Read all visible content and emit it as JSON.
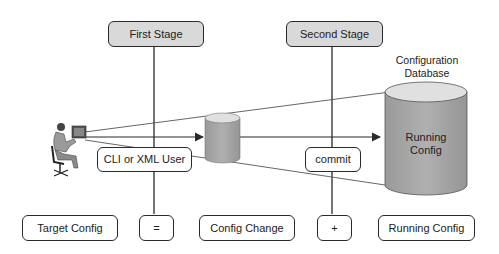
{
  "stages": {
    "first": "First Stage",
    "second": "Second Stage"
  },
  "user": {
    "label": "CLI or XML User",
    "icon": "person-at-workstation-icon"
  },
  "commit_label": "commit",
  "database": {
    "title_line1": "Configuration",
    "title_line2": "Database",
    "cylinder_line1": "Running",
    "cylinder_line2": "Config"
  },
  "equation": {
    "target": "Target Config",
    "equals": "=",
    "change": "Config Change",
    "plus": "+",
    "running": "Running Config"
  },
  "colors": {
    "stage_fill": "#d9d9d9",
    "cylinder_fill": "#a6a6a6",
    "cylinder_top": "#e0e0e0",
    "line": "#2a2a2a"
  }
}
